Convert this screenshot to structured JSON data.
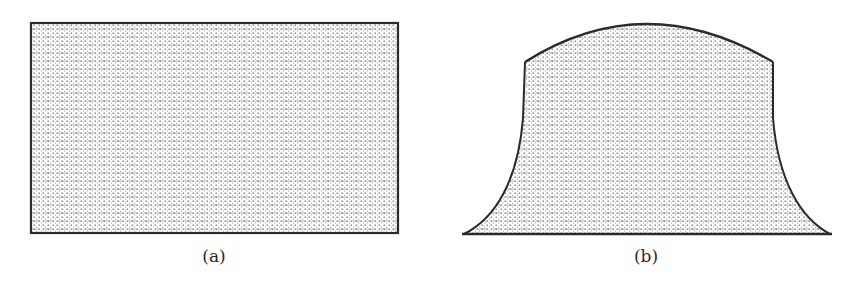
{
  "figure": {
    "panels": [
      {
        "id": "a",
        "label": "(a)",
        "shape": "rectangle",
        "description": "Undeformed rectangular block with stippled fill"
      },
      {
        "id": "b",
        "label": "(b)",
        "shape": "barrel-flared",
        "description": "Deformed block: bulged convex top, straight upper sides, concave flaring lower sides, flat base"
      }
    ],
    "colors": {
      "outline": "#2b2b2b",
      "stipple": "#555555",
      "background": "#ffffff"
    }
  }
}
